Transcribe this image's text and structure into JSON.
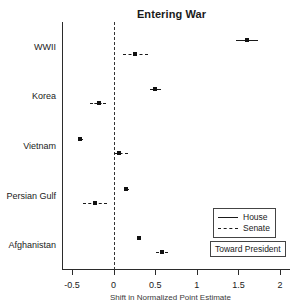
{
  "chart_data": {
    "type": "scatter",
    "title": "Entering War",
    "xlabel": "Shift in Normalized Point Estimate",
    "ylabel": "",
    "xlim": [
      -0.62,
      2.12
    ],
    "xticks": [
      -0.5,
      0,
      0.5,
      1,
      1.5,
      2
    ],
    "xtick_labels": [
      "-0.5",
      "0",
      "0.5",
      "1",
      "1.5",
      "2"
    ],
    "categories": [
      "WWII",
      "Korea",
      "Vietnam",
      "Persian Gulf",
      "Afghanistan"
    ],
    "grid": false,
    "reference_line": 0,
    "legend_position": "bottom-right",
    "annotation": "Toward President",
    "series": [
      {
        "name": "House",
        "style": "solid",
        "values": [
          1.6,
          0.5,
          -0.4,
          0.15,
          0.3
        ],
        "ci_low": [
          1.47,
          0.44,
          -0.43,
          0.12,
          0.28
        ],
        "ci_high": [
          1.73,
          0.57,
          -0.37,
          0.19,
          0.33
        ]
      },
      {
        "name": "Senate",
        "style": "dashed",
        "values": [
          0.26,
          -0.18,
          0.07,
          -0.22,
          0.58
        ],
        "ci_low": [
          0.11,
          -0.28,
          0.01,
          -0.37,
          0.51
        ],
        "ci_high": [
          0.41,
          -0.09,
          0.17,
          -0.08,
          0.65
        ]
      }
    ]
  },
  "legend": {
    "items": [
      {
        "label": "House",
        "style": "solid"
      },
      {
        "label": "Senate",
        "style": "dashed"
      }
    ]
  }
}
